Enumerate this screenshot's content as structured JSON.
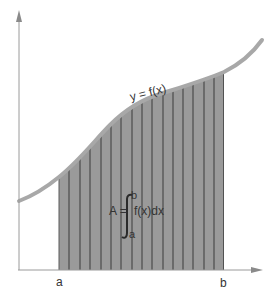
{
  "diagram": {
    "curve_label": "y = f(x)",
    "formula": {
      "lhs": "A =",
      "integrand": "f(x)dx",
      "upper_limit": "b",
      "lower_limit": "a"
    },
    "x_axis_labels": {
      "a": "a",
      "b": "b"
    },
    "colors": {
      "background": "#ffffff",
      "shaded_area": "#9a9a9a",
      "strip_lines": "#3a3a3a",
      "curve": "#a8a8a8",
      "axes": "#9a9a9a",
      "text": "#333333"
    },
    "strip_count": 16
  }
}
